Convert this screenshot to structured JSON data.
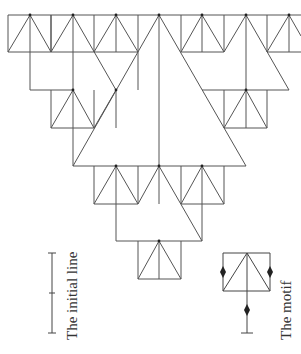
{
  "figure": {
    "stroke_color": "#555555",
    "dot_color": "#222222",
    "background": "#ffffff",
    "labels": {
      "initial_line": "The initial line",
      "motif": "The motif"
    }
  },
  "geometry": {
    "lines": [
      [
        8,
        15,
        301,
        15
      ],
      [
        8,
        15,
        8,
        52
      ],
      [
        8,
        52,
        51,
        52
      ],
      [
        30,
        15,
        30,
        52
      ],
      [
        51,
        15,
        51,
        52
      ],
      [
        8,
        52,
        30,
        15
      ],
      [
        30,
        15,
        51,
        52
      ],
      [
        51,
        15,
        51,
        52
      ],
      [
        73,
        15,
        73,
        90
      ],
      [
        30,
        52,
        30,
        90
      ],
      [
        30,
        90,
        73,
        90
      ],
      [
        51,
        52,
        73,
        15
      ],
      [
        94,
        15,
        94,
        52
      ],
      [
        51,
        52,
        94,
        52
      ],
      [
        73,
        15,
        116,
        90
      ],
      [
        116,
        15,
        116,
        52
      ],
      [
        94,
        52,
        138,
        52
      ],
      [
        94,
        52,
        116,
        15
      ],
      [
        116,
        15,
        138,
        52
      ],
      [
        138,
        15,
        138,
        52
      ],
      [
        159,
        15,
        159,
        166
      ],
      [
        159,
        15,
        73,
        166
      ],
      [
        159,
        15,
        246,
        166
      ],
      [
        181,
        15,
        181,
        52
      ],
      [
        181,
        52,
        224,
        52
      ],
      [
        202,
        15,
        202,
        52
      ],
      [
        181,
        52,
        202,
        15
      ],
      [
        202,
        15,
        224,
        52
      ],
      [
        224,
        15,
        224,
        52
      ],
      [
        224,
        52,
        246,
        15
      ],
      [
        246,
        15,
        246,
        90
      ],
      [
        246,
        15,
        289,
        90
      ],
      [
        202,
        90,
        289,
        90
      ],
      [
        267,
        15,
        267,
        52
      ],
      [
        267,
        52,
        301,
        52
      ],
      [
        267,
        52,
        289,
        15
      ],
      [
        289,
        15,
        301,
        36
      ],
      [
        289,
        15,
        289,
        52
      ],
      [
        51,
        90,
        51,
        128
      ],
      [
        51,
        128,
        94,
        128
      ],
      [
        73,
        90,
        73,
        166
      ],
      [
        51,
        128,
        73,
        90
      ],
      [
        73,
        90,
        94,
        128
      ],
      [
        94,
        90,
        94,
        128
      ],
      [
        94,
        128,
        116,
        90
      ],
      [
        116,
        90,
        116,
        128
      ],
      [
        138,
        90,
        138,
        52
      ],
      [
        224,
        90,
        224,
        128
      ],
      [
        224,
        128,
        267,
        128
      ],
      [
        246,
        90,
        246,
        128
      ],
      [
        224,
        128,
        246,
        90
      ],
      [
        246,
        90,
        267,
        128
      ],
      [
        267,
        90,
        267,
        128
      ],
      [
        73,
        166,
        246,
        166
      ],
      [
        94,
        166,
        94,
        204
      ],
      [
        94,
        204,
        138,
        204
      ],
      [
        116,
        166,
        116,
        241
      ],
      [
        94,
        204,
        116,
        166
      ],
      [
        116,
        166,
        138,
        204
      ],
      [
        138,
        166,
        138,
        204
      ],
      [
        138,
        204,
        159,
        166
      ],
      [
        159,
        166,
        159,
        204
      ],
      [
        159,
        166,
        202,
        241
      ],
      [
        116,
        241,
        202,
        241
      ],
      [
        181,
        166,
        181,
        204
      ],
      [
        181,
        204,
        224,
        204
      ],
      [
        181,
        204,
        202,
        166
      ],
      [
        202,
        166,
        224,
        204
      ],
      [
        202,
        166,
        202,
        241
      ],
      [
        224,
        166,
        224,
        204
      ],
      [
        138,
        241,
        138,
        279
      ],
      [
        138,
        279,
        181,
        279
      ],
      [
        159,
        241,
        159,
        279
      ],
      [
        138,
        279,
        159,
        241
      ],
      [
        159,
        241,
        181,
        279
      ],
      [
        181,
        241,
        181,
        279
      ]
    ],
    "dots": [
      [
        30,
        15
      ],
      [
        73,
        15
      ],
      [
        116,
        15
      ],
      [
        159,
        15
      ],
      [
        202,
        15
      ],
      [
        246,
        15
      ],
      [
        289,
        15
      ],
      [
        73,
        90
      ],
      [
        116,
        90
      ],
      [
        246,
        90
      ],
      [
        116,
        166
      ],
      [
        159,
        166
      ],
      [
        202,
        166
      ],
      [
        159,
        241
      ]
    ],
    "initial_line": {
      "x": 52,
      "y1": 253,
      "y2": 333,
      "mid": 293
    },
    "motif": {
      "x1": 223,
      "x2": 270,
      "top": 253,
      "bottom": 291,
      "apex": 247,
      "stem_bottom": 333,
      "diamonds": [
        [
          223,
          272
        ],
        [
          270,
          272
        ],
        [
          247,
          310
        ]
      ]
    }
  }
}
